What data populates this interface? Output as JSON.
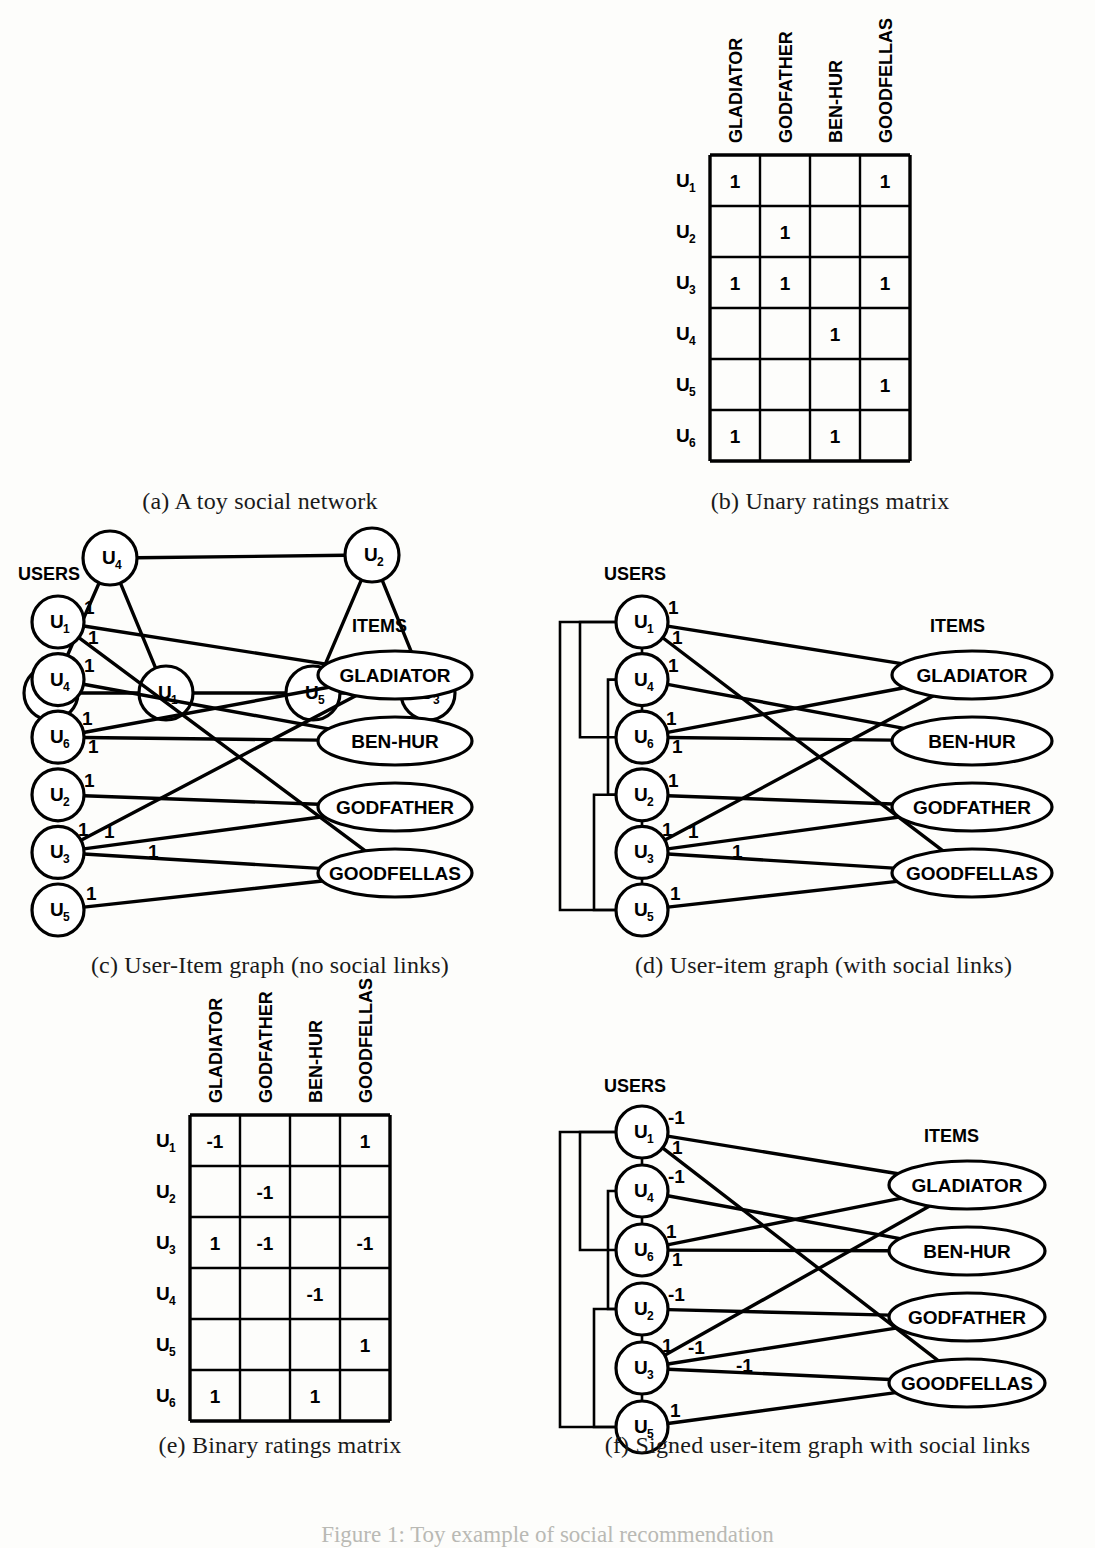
{
  "figure": {
    "bottom_note": "Figure 1: Toy example of social recommendation",
    "users": [
      "U1",
      "U2",
      "U3",
      "U4",
      "U5",
      "U6"
    ],
    "items": [
      "GLADIATOR",
      "GODFATHER",
      "BEN-HUR",
      "GOODFELLAS"
    ]
  },
  "panel_a": {
    "caption": "(a) A toy social network",
    "nodes": [
      {
        "id": "U4",
        "label": "U",
        "sub": "4",
        "x": 110,
        "y": 308
      },
      {
        "id": "U2",
        "label": "U",
        "sub": "2",
        "x": 372,
        "y": 305
      },
      {
        "id": "U6",
        "label": "U",
        "sub": "6",
        "x": 51,
        "y": 443
      },
      {
        "id": "U1",
        "label": "U",
        "sub": "1",
        "x": 166,
        "y": 443
      },
      {
        "id": "U5",
        "label": "U",
        "sub": "5",
        "x": 313,
        "y": 443
      },
      {
        "id": "U3",
        "label": "U",
        "sub": "3",
        "x": 428,
        "y": 443
      }
    ],
    "edges": [
      [
        "U4",
        "U2"
      ],
      [
        "U4",
        "U6"
      ],
      [
        "U4",
        "U1"
      ],
      [
        "U6",
        "U1"
      ],
      [
        "U1",
        "U5"
      ],
      [
        "U5",
        "U2"
      ],
      [
        "U5",
        "U3"
      ],
      [
        "U2",
        "U3"
      ]
    ]
  },
  "panel_b": {
    "caption": "(b) Unary ratings matrix",
    "columns": [
      "GLADIATOR",
      "GODFATHER",
      "BEN-HUR",
      "GOODFELLAS"
    ],
    "rows": [
      "U1",
      "U2",
      "U3",
      "U4",
      "U5",
      "U6"
    ],
    "values": [
      [
        "1",
        "",
        "",
        "1"
      ],
      [
        "",
        "1",
        "",
        ""
      ],
      [
        "1",
        "1",
        "",
        "1"
      ],
      [
        "",
        "",
        "1",
        ""
      ],
      [
        "",
        "",
        "",
        "1"
      ],
      [
        "1",
        "",
        "1",
        ""
      ]
    ]
  },
  "panel_c": {
    "caption": "(c) User-Item graph (no social links)",
    "users_header": "USERS",
    "items_header": "ITEMS",
    "users": [
      {
        "id": "U1",
        "label": "U",
        "sub": "1"
      },
      {
        "id": "U4",
        "label": "U",
        "sub": "4"
      },
      {
        "id": "U6",
        "label": "U",
        "sub": "6"
      },
      {
        "id": "U2",
        "label": "U",
        "sub": "2"
      },
      {
        "id": "U3",
        "label": "U",
        "sub": "3"
      },
      {
        "id": "U5",
        "label": "U",
        "sub": "5"
      }
    ],
    "items": [
      "GLADIATOR",
      "BEN-HUR",
      "GODFATHER",
      "GOODFELLAS"
    ],
    "edges": [
      {
        "user": "U1",
        "item": "GLADIATOR",
        "weight": "1"
      },
      {
        "user": "U1",
        "item": "GOODFELLAS",
        "weight": "1"
      },
      {
        "user": "U4",
        "item": "BEN-HUR",
        "weight": "1"
      },
      {
        "user": "U6",
        "item": "GLADIATOR",
        "weight": "1"
      },
      {
        "user": "U6",
        "item": "BEN-HUR",
        "weight": "1"
      },
      {
        "user": "U2",
        "item": "GODFATHER",
        "weight": "1"
      },
      {
        "user": "U3",
        "item": "GLADIATOR",
        "weight": "1"
      },
      {
        "user": "U3",
        "item": "GODFATHER",
        "weight": "1"
      },
      {
        "user": "U3",
        "item": "GOODFELLAS",
        "weight": "1"
      },
      {
        "user": "U5",
        "item": "GOODFELLAS",
        "weight": "1"
      }
    ]
  },
  "panel_d": {
    "caption": "(d) User-item graph (with social links)",
    "users_header": "USERS",
    "items_header": "ITEMS",
    "users": [
      {
        "id": "U1",
        "label": "U",
        "sub": "1"
      },
      {
        "id": "U4",
        "label": "U",
        "sub": "4"
      },
      {
        "id": "U6",
        "label": "U",
        "sub": "6"
      },
      {
        "id": "U2",
        "label": "U",
        "sub": "2"
      },
      {
        "id": "U3",
        "label": "U",
        "sub": "3"
      },
      {
        "id": "U5",
        "label": "U",
        "sub": "5"
      }
    ],
    "items": [
      "GLADIATOR",
      "BEN-HUR",
      "GODFATHER",
      "GOODFELLAS"
    ],
    "edges": [
      {
        "user": "U1",
        "item": "GLADIATOR",
        "weight": "1"
      },
      {
        "user": "U1",
        "item": "GOODFELLAS",
        "weight": "1"
      },
      {
        "user": "U4",
        "item": "BEN-HUR",
        "weight": "1"
      },
      {
        "user": "U6",
        "item": "GLADIATOR",
        "weight": "1"
      },
      {
        "user": "U6",
        "item": "BEN-HUR",
        "weight": "1"
      },
      {
        "user": "U2",
        "item": "GODFATHER",
        "weight": "1"
      },
      {
        "user": "U3",
        "item": "GLADIATOR",
        "weight": "1"
      },
      {
        "user": "U3",
        "item": "GODFATHER",
        "weight": "1"
      },
      {
        "user": "U3",
        "item": "GOODFELLAS",
        "weight": "1"
      },
      {
        "user": "U5",
        "item": "GOODFELLAS",
        "weight": "1"
      }
    ],
    "social_edges": [
      [
        "U1",
        "U4"
      ],
      [
        "U4",
        "U6"
      ],
      [
        "U1",
        "U6"
      ],
      [
        "U1",
        "U5"
      ],
      [
        "U2",
        "U5"
      ],
      [
        "U2",
        "U3"
      ],
      [
        "U3",
        "U5"
      ],
      [
        "U4",
        "U2"
      ]
    ]
  },
  "panel_e": {
    "caption": "(e) Binary ratings matrix",
    "columns": [
      "GLADIATOR",
      "GODFATHER",
      "BEN-HUR",
      "GOODFELLAS"
    ],
    "rows": [
      "U1",
      "U2",
      "U3",
      "U4",
      "U5",
      "U6"
    ],
    "values": [
      [
        "-1",
        "",
        "",
        "1"
      ],
      [
        "",
        "-1",
        "",
        ""
      ],
      [
        "1",
        "-1",
        "",
        "-1"
      ],
      [
        "",
        "",
        "-1",
        ""
      ],
      [
        "",
        "",
        "",
        "1"
      ],
      [
        "1",
        "",
        "1",
        ""
      ]
    ]
  },
  "panel_f": {
    "caption": "(f) Signed user-item graph with social links",
    "users_header": "USERS",
    "items_header": "ITEMS",
    "users": [
      {
        "id": "U1",
        "label": "U",
        "sub": "1"
      },
      {
        "id": "U4",
        "label": "U",
        "sub": "4"
      },
      {
        "id": "U6",
        "label": "U",
        "sub": "6"
      },
      {
        "id": "U2",
        "label": "U",
        "sub": "2"
      },
      {
        "id": "U3",
        "label": "U",
        "sub": "3"
      },
      {
        "id": "U5",
        "label": "U",
        "sub": "5"
      }
    ],
    "items": [
      "GLADIATOR",
      "BEN-HUR",
      "GODFATHER",
      "GOODFELLAS"
    ],
    "edges": [
      {
        "user": "U1",
        "item": "GLADIATOR",
        "weight": "-1"
      },
      {
        "user": "U1",
        "item": "GOODFELLAS",
        "weight": "1"
      },
      {
        "user": "U4",
        "item": "BEN-HUR",
        "weight": "-1"
      },
      {
        "user": "U6",
        "item": "GLADIATOR",
        "weight": "1"
      },
      {
        "user": "U6",
        "item": "BEN-HUR",
        "weight": "1"
      },
      {
        "user": "U2",
        "item": "GODFATHER",
        "weight": "-1"
      },
      {
        "user": "U3",
        "item": "GLADIATOR",
        "weight": "1"
      },
      {
        "user": "U3",
        "item": "GODFATHER",
        "weight": "-1"
      },
      {
        "user": "U3",
        "item": "GOODFELLAS",
        "weight": "-1"
      },
      {
        "user": "U5",
        "item": "GOODFELLAS",
        "weight": "1"
      }
    ],
    "social_edges": [
      [
        "U1",
        "U4"
      ],
      [
        "U4",
        "U6"
      ],
      [
        "U1",
        "U6"
      ],
      [
        "U1",
        "U5"
      ],
      [
        "U2",
        "U5"
      ],
      [
        "U2",
        "U3"
      ],
      [
        "U3",
        "U5"
      ],
      [
        "U4",
        "U2"
      ]
    ]
  },
  "colors": {
    "ink": "#000000",
    "paper": "#fdfdfb"
  }
}
